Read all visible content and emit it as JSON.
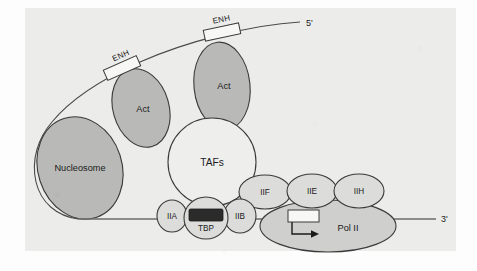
{
  "figure": {
    "background_color": "#ececeb",
    "page_color": "#fdfdfd",
    "stroke_color": "#3a3a3a",
    "fill_shaded": "#b9b9b7",
    "fill_light": "#e3e3e1",
    "fill_white": "#f4f4f2",
    "fill_dark": "#2b2b2b"
  },
  "dna": {
    "five_prime_label": "5'",
    "three_prime_label": "3'",
    "enhancer_label_1": "ENH",
    "enhancer_label_2": "ENH"
  },
  "complexes": {
    "nucleosome": "Nucleosome",
    "activator_1": "Act",
    "activator_2": "Act",
    "tafs": "TAFs",
    "tbp": "TBP",
    "tfiia": "IIA",
    "tfiib": "IIB",
    "tfiif": "IIF",
    "tfiie": "IIE",
    "tfiih": "IIH",
    "polymerase": "Pol II"
  },
  "elements": {
    "tata_box_label": "",
    "start_arrow_label": ""
  }
}
